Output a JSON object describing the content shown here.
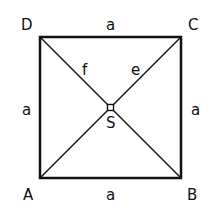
{
  "diagram": {
    "vertices": [
      {
        "name": "A",
        "x": 40,
        "y": 178
      },
      {
        "name": "B",
        "x": 181,
        "y": 178
      },
      {
        "name": "C",
        "x": 181,
        "y": 37
      },
      {
        "name": "D",
        "x": 40,
        "y": 37
      }
    ],
    "center": {
      "name": "S",
      "x": 110.5,
      "y": 107.5
    },
    "labels": {
      "A": "A",
      "B": "B",
      "C": "C",
      "D": "D",
      "S": "S",
      "side_top": "a",
      "side_bottom": "a",
      "side_left": "a",
      "side_right": "a",
      "diag_f": "f",
      "diag_e": "e"
    },
    "colors": {
      "stroke": "#111111",
      "background": "#ffffff"
    }
  }
}
